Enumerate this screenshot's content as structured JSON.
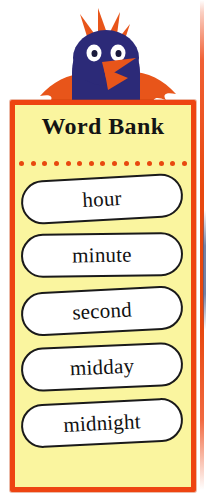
{
  "panel": {
    "title": "Word Bank",
    "background_color": "#faf59f",
    "border_color": "#ee4411",
    "divider_dot_color": "#e8480f",
    "divider_dot_count": 15
  },
  "words": [
    {
      "label": "hour"
    },
    {
      "label": "minute"
    },
    {
      "label": "second"
    },
    {
      "label": "midday"
    },
    {
      "label": "midnight"
    }
  ],
  "illustration": {
    "name": "blue-bird-character",
    "body_color": "#2c2a78",
    "accent_color": "#e8551a",
    "eye_color": "#ffffff",
    "pupil_color": "#1a1a3c"
  },
  "edge": {
    "sliver_orange": "#e8480f",
    "sliver_blue": "#5a6e96"
  }
}
